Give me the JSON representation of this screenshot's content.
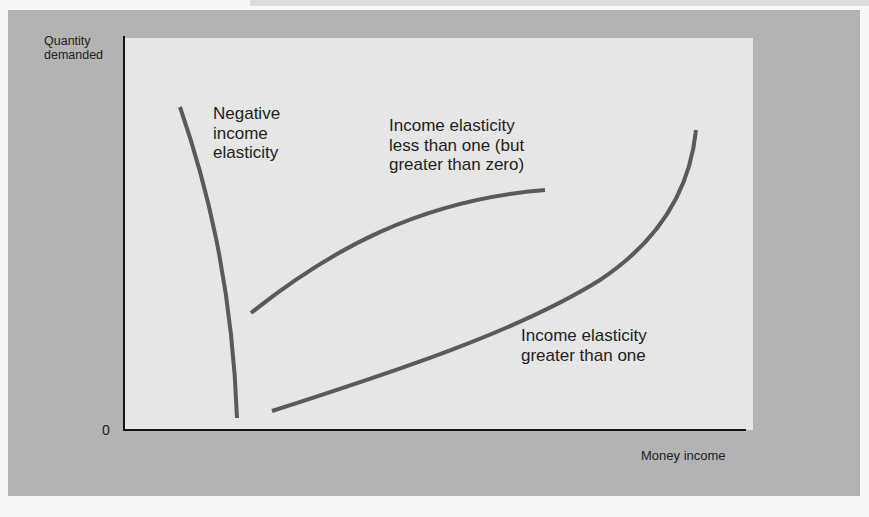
{
  "figure": {
    "y_axis_label_line1": "Quantity",
    "y_axis_label_line2": "demanded",
    "x_axis_label": "Money income",
    "origin_label": "0",
    "colors": {
      "frame": "#b3b3b3",
      "panel": "#e6e6e6",
      "curve": "#5a5a5a",
      "axis": "#111111",
      "text": "#222222"
    }
  },
  "curves": [
    {
      "id": "negative",
      "label_lines": [
        "Negative",
        "income",
        "elasticity"
      ],
      "description": "Downward-sloping: quantity falls as income rises"
    },
    {
      "id": "less-than-one",
      "label_lines": [
        "Income elasticity",
        "less than one (but",
        "greater than zero)"
      ],
      "description": "Upward-sloping, concave: quantity rises at a decreasing rate"
    },
    {
      "id": "greater-than-one",
      "label_lines": [
        "Income elasticity",
        "greater than one"
      ],
      "description": "Upward-sloping, convex: quantity rises at an increasing rate"
    }
  ]
}
